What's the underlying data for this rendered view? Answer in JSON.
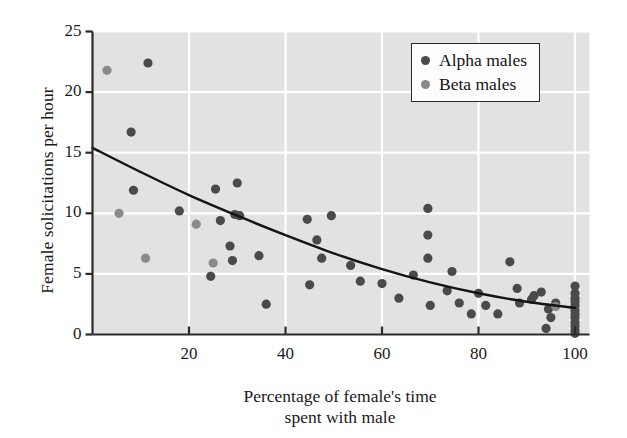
{
  "chart_data": {
    "type": "scatter",
    "title": "",
    "xlabel": "Percentage of female's time spent with male",
    "xlabel_line1": "Percentage of female's time",
    "xlabel_line2": "spent with male",
    "ylabel": "Female solicitations per hour",
    "xlim": [
      0,
      103
    ],
    "ylim": [
      0,
      25
    ],
    "xticks": [
      20,
      40,
      60,
      80,
      100
    ],
    "xtick_labels": [
      "20",
      "40",
      "60",
      "80",
      "100"
    ],
    "yticks": [
      0,
      5,
      10,
      15,
      20,
      25
    ],
    "ytick_labels": [
      "0",
      "5",
      "10",
      "15",
      "20",
      "25"
    ],
    "grid": true,
    "grid_color": "#ffffff",
    "plot_background": "#e2e2e2",
    "axis_color": "#2b2b2b",
    "legend_position": "top-right",
    "legend": [
      {
        "name": "Alpha males",
        "color": "#4a4a4a"
      },
      {
        "name": "Beta males",
        "color": "#8a8a8a"
      }
    ],
    "series": [
      {
        "name": "Alpha males",
        "color": "#4a4a4a",
        "marker": "circle",
        "points": [
          [
            11.5,
            22.4
          ],
          [
            8.0,
            16.7
          ],
          [
            8.5,
            11.9
          ],
          [
            18.0,
            10.2
          ],
          [
            24.5,
            4.8
          ],
          [
            25.5,
            12.0
          ],
          [
            26.5,
            9.4
          ],
          [
            28.5,
            7.3
          ],
          [
            30.0,
            12.5
          ],
          [
            29.5,
            9.9
          ],
          [
            30.5,
            9.8
          ],
          [
            29.0,
            6.1
          ],
          [
            36.0,
            2.5
          ],
          [
            34.5,
            6.5
          ],
          [
            44.5,
            9.5
          ],
          [
            45.0,
            4.1
          ],
          [
            46.5,
            7.8
          ],
          [
            47.5,
            6.3
          ],
          [
            49.5,
            9.8
          ],
          [
            53.5,
            5.7
          ],
          [
            55.5,
            4.4
          ],
          [
            60.0,
            4.2
          ],
          [
            63.5,
            3.0
          ],
          [
            66.5,
            4.9
          ],
          [
            69.5,
            10.4
          ],
          [
            69.5,
            8.2
          ],
          [
            69.5,
            6.3
          ],
          [
            70.0,
            2.4
          ],
          [
            74.5,
            5.2
          ],
          [
            73.5,
            3.6
          ],
          [
            76.0,
            2.6
          ],
          [
            78.5,
            1.7
          ],
          [
            80.0,
            3.4
          ],
          [
            81.5,
            2.4
          ],
          [
            84.0,
            1.7
          ],
          [
            86.5,
            6.0
          ],
          [
            88.0,
            3.8
          ],
          [
            88.5,
            2.6
          ],
          [
            91.5,
            3.2
          ],
          [
            93.0,
            3.5
          ],
          [
            91.0,
            2.9
          ],
          [
            94.5,
            2.1
          ],
          [
            96.0,
            2.6
          ],
          [
            95.0,
            1.4
          ],
          [
            94.0,
            0.5
          ],
          [
            100.0,
            4.0
          ],
          [
            100.0,
            3.4
          ],
          [
            100.0,
            3.0
          ],
          [
            100.0,
            2.7
          ],
          [
            100.0,
            2.4
          ],
          [
            100.0,
            2.0
          ],
          [
            100.0,
            1.7
          ],
          [
            100.0,
            1.4
          ],
          [
            100.0,
            1.0
          ],
          [
            100.0,
            0.7
          ],
          [
            100.0,
            0.35
          ],
          [
            100.0,
            0.1
          ]
        ]
      },
      {
        "name": "Beta males",
        "color": "#8a8a8a",
        "marker": "circle",
        "points": [
          [
            3.0,
            21.8
          ],
          [
            5.5,
            10.0
          ],
          [
            11.0,
            6.3
          ],
          [
            21.5,
            9.1
          ],
          [
            25.0,
            5.9
          ],
          [
            96.0,
            2.3
          ]
        ]
      }
    ],
    "trend_line": {
      "label": "fitted curve",
      "color": "#141414",
      "points": [
        [
          0,
          15.4
        ],
        [
          10,
          13.4
        ],
        [
          20,
          11.5
        ],
        [
          30,
          9.8
        ],
        [
          40,
          8.2
        ],
        [
          50,
          6.7
        ],
        [
          60,
          5.4
        ],
        [
          70,
          4.3
        ],
        [
          80,
          3.4
        ],
        [
          90,
          2.7
        ],
        [
          100,
          2.2
        ]
      ]
    }
  }
}
